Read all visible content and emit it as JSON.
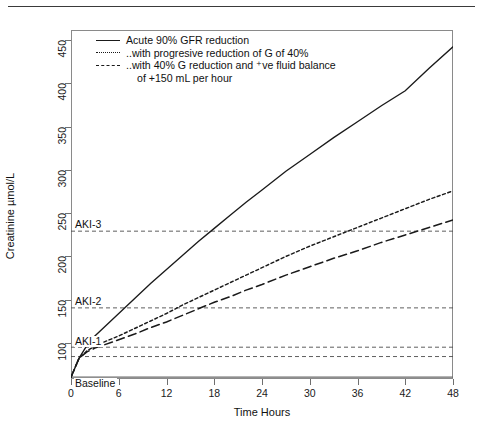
{
  "figure": {
    "y_axis_title": "Creatinine µmol/L",
    "x_axis_title": "Time Hours",
    "y_ticks": [
      "100",
      "150",
      "200",
      "250",
      "300",
      "350",
      "400",
      "450"
    ],
    "x_ticks": [
      "0",
      "6",
      "12",
      "18",
      "24",
      "30",
      "36",
      "42",
      "48"
    ],
    "threshold_labels": {
      "aki3": "AKI-3",
      "aki2": "AKI-2",
      "aki1": "AKI-1",
      "baseline": "Baseline"
    }
  },
  "legend": {
    "items": [
      {
        "key": "solid",
        "label": "Acute 90% GFR reduction"
      },
      {
        "key": "dotted",
        "label": "..with progresive reduction of G of 40%"
      },
      {
        "key": "dashed",
        "label": "..with 40% G reduction and ⁺ve fluid balance"
      }
    ],
    "continuation": "of +150 mL per hour"
  },
  "colors": {
    "line": "#1a1a1a",
    "frame": "#8a8a8a",
    "threshold": "#555555",
    "background": "#ffffff"
  },
  "chart_data": {
    "type": "line",
    "title": "",
    "xlabel": "Time Hours",
    "ylabel": "Creatinine µmol/L",
    "xlim": [
      0,
      48
    ],
    "ylim": [
      82,
      455
    ],
    "grid": false,
    "legend_position": "top-left",
    "x": [
      0,
      1,
      2,
      3,
      4,
      6,
      8,
      10,
      12,
      14,
      16,
      18,
      20,
      22,
      24,
      27,
      30,
      33,
      36,
      39,
      42,
      45,
      48
    ],
    "series": [
      {
        "name": "Acute 90% GFR reduction",
        "style": "solid",
        "values": [
          84,
          104,
          118,
          128,
          136,
          152,
          168,
          184,
          199,
          214,
          229,
          243,
          257,
          271,
          284,
          304,
          322,
          340,
          357,
          374,
          390,
          414,
          437
        ]
      },
      {
        "name": "..with progresive reduction of G of 40%",
        "style": "dotted",
        "values": [
          84,
          104,
          112,
          117,
          121,
          128,
          136,
          144,
          152,
          161,
          169,
          177,
          185,
          193,
          201,
          213,
          224,
          234,
          244,
          254,
          264,
          274,
          283
        ]
      },
      {
        "name": "..with 40% G reduction and ⁺ve fluid balance",
        "style": "dashed",
        "values": [
          84,
          104,
          111,
          115,
          118,
          124,
          130,
          137,
          143,
          150,
          157,
          164,
          170,
          177,
          183,
          193,
          202,
          211,
          219,
          228,
          236,
          244,
          252
        ]
      }
    ],
    "threshold_lines": [
      {
        "label": "AKI-3",
        "value": 240
      },
      {
        "label": "AKI-2",
        "value": 158
      },
      {
        "label": "AKI-1",
        "value": 116
      },
      {
        "label": "AKI-1-lower",
        "value": 106
      },
      {
        "label": "Baseline",
        "value": 84
      }
    ]
  }
}
